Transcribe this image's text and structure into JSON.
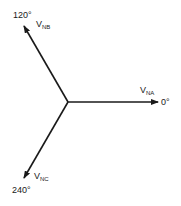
{
  "diagram": {
    "type": "phasor",
    "origin": {
      "x": 68,
      "y": 102
    },
    "phasors": [
      {
        "name": "V",
        "subscript": "NA",
        "angle_label": "0°",
        "angle": 0
      },
      {
        "name": "V",
        "subscript": "NB",
        "angle_label": "120°",
        "angle": 120
      },
      {
        "name": "V",
        "subscript": "NC",
        "angle_label": "240°",
        "angle": 240
      }
    ]
  }
}
